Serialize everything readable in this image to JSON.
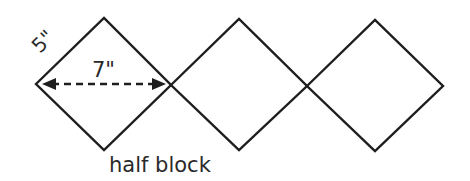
{
  "diagram": {
    "type": "quilt-setting-diagram",
    "shapes": [
      {
        "name": "half-block-1",
        "shape": "diamond",
        "center": [
          104,
          85
        ]
      },
      {
        "name": "half-block-2",
        "shape": "diamond",
        "center": [
          239,
          85
        ]
      },
      {
        "name": "half-block-3",
        "shape": "diamond",
        "center": [
          375,
          86
        ]
      }
    ],
    "labels": {
      "side_length": "5\"",
      "diagonal_width": "7\"",
      "caption": "half block"
    },
    "colors": {
      "stroke": "#1e1e1e",
      "text": "#2a2a2a",
      "background": "#ffffff"
    }
  }
}
